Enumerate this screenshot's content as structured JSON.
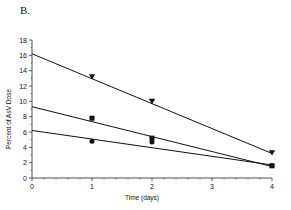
{
  "panel_label": "B.",
  "chart_data": {
    "type": "line",
    "title": "",
    "xlabel": "Time (days)",
    "ylabel": "Percent of AsV Dose",
    "xlim": [
      0,
      4
    ],
    "ylim": [
      0,
      18
    ],
    "xticks": [
      0,
      1,
      2,
      3,
      4
    ],
    "yticks": [
      0,
      2,
      4,
      6,
      8,
      10,
      12,
      14,
      16,
      18
    ],
    "grid": false,
    "legend": null,
    "series": [
      {
        "name": "triangles",
        "marker": "triangle-down",
        "points": [
          {
            "x": 1,
            "y": 13.2
          },
          {
            "x": 2,
            "y": 10.0
          },
          {
            "x": 4,
            "y": 3.3
          }
        ],
        "fit_line": [
          {
            "x": 0,
            "y": 16.2
          },
          {
            "x": 4,
            "y": 3.2
          }
        ]
      },
      {
        "name": "squares",
        "marker": "square",
        "points": [
          {
            "x": 1,
            "y": 7.8
          },
          {
            "x": 2,
            "y": 5.2
          },
          {
            "x": 4,
            "y": 1.6
          }
        ],
        "fit_line": [
          {
            "x": 0,
            "y": 9.3
          },
          {
            "x": 4,
            "y": 1.5
          }
        ]
      },
      {
        "name": "circles",
        "marker": "circle",
        "points": [
          {
            "x": 1,
            "y": 4.8
          },
          {
            "x": 2,
            "y": 4.7
          },
          {
            "x": 4,
            "y": 1.6
          }
        ],
        "fit_line": [
          {
            "x": 0,
            "y": 6.2
          },
          {
            "x": 4,
            "y": 1.7
          }
        ]
      }
    ]
  }
}
